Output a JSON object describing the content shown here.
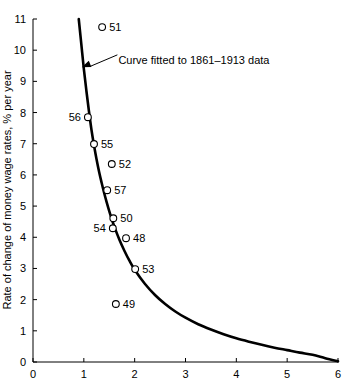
{
  "chart_data": {
    "type": "scatter",
    "title": "",
    "subtitle": "",
    "xlabel": "",
    "ylabel": "Rate of change of money wage rates, % per year",
    "xlim": [
      0,
      6
    ],
    "ylim": [
      0,
      11
    ],
    "xticks": [
      "0",
      "1",
      "2",
      "3",
      "4",
      "5",
      "6"
    ],
    "yticks": [
      "0",
      "1",
      "2",
      "3",
      "4",
      "5",
      "6",
      "7",
      "8",
      "9",
      "10",
      "11"
    ],
    "grid": false,
    "legend": "none",
    "points": [
      {
        "label": "51",
        "x": 1.36,
        "y": 10.74,
        "label_side": "right"
      },
      {
        "label": "56",
        "x": 1.08,
        "y": 7.85,
        "label_side": "left"
      },
      {
        "label": "55",
        "x": 1.2,
        "y": 6.99,
        "label_side": "right"
      },
      {
        "label": "52",
        "x": 1.55,
        "y": 6.35,
        "label_side": "right"
      },
      {
        "label": "57",
        "x": 1.46,
        "y": 5.51,
        "label_side": "right"
      },
      {
        "label": "50",
        "x": 1.58,
        "y": 4.61,
        "label_side": "right"
      },
      {
        "label": "54",
        "x": 1.57,
        "y": 4.29,
        "label_side": "left"
      },
      {
        "label": "48",
        "x": 1.83,
        "y": 3.97,
        "label_side": "right"
      },
      {
        "label": "53",
        "x": 2.01,
        "y": 2.98,
        "label_side": "right"
      },
      {
        "label": "49",
        "x": 1.63,
        "y": 1.86,
        "label_side": "right"
      }
    ],
    "series": [
      {
        "name": "Curve fitted to 1861-1913 data",
        "type": "line",
        "x": [
          0.9,
          0.95,
          1.0,
          1.05,
          1.1,
          1.15,
          1.2,
          1.25,
          1.3,
          1.35,
          1.4,
          1.45,
          1.5,
          1.55,
          1.6,
          1.7,
          1.8,
          1.9,
          2.0,
          2.2,
          2.4,
          2.6,
          2.8,
          3.0,
          3.25,
          3.5,
          3.75,
          4.0,
          4.25,
          4.5,
          4.75,
          5.0,
          5.25,
          5.5,
          5.75,
          6.0
        ],
        "y": [
          11.0,
          10.2,
          9.4,
          8.7,
          8.05,
          7.45,
          6.95,
          6.5,
          6.1,
          5.75,
          5.42,
          5.12,
          4.84,
          4.58,
          4.34,
          3.92,
          3.56,
          3.24,
          2.96,
          2.51,
          2.15,
          1.86,
          1.62,
          1.42,
          1.21,
          1.04,
          0.89,
          0.76,
          0.65,
          0.55,
          0.46,
          0.38,
          0.3,
          0.23,
          0.12,
          0.02
        ]
      }
    ],
    "annotations": [
      {
        "name": "curve-fit-annotation",
        "text": "Curve fitted to 1861–1913 data",
        "text_x": 1.68,
        "text_y": 9.7,
        "arrow_tip_x": 0.96,
        "arrow_tip_y": 9.45,
        "arrow_tail_x": 1.66,
        "arrow_tail_y": 9.85
      }
    ]
  }
}
